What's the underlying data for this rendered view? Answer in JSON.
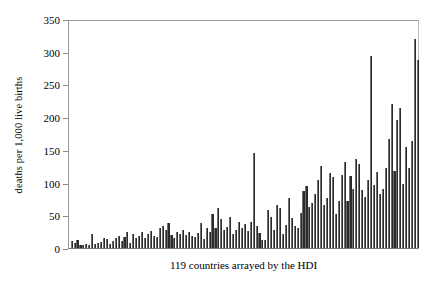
{
  "chart_data": {
    "type": "bar",
    "title": "",
    "xlabel": "119 countries arrayed by the HDI",
    "ylabel": "deaths per 1,000 live births",
    "ylim": [
      0,
      350
    ],
    "yticks": [
      0,
      50,
      100,
      150,
      200,
      250,
      300,
      350
    ],
    "ytick_labels": [
      "0",
      "50",
      "100",
      "150",
      "200",
      "250",
      "300",
      "350"
    ],
    "grid": false,
    "legend": null,
    "n_categories": 119,
    "categories_note": "119 countries ordered by Human Development Index (HDI), unlabeled on axis",
    "bar_color": "#2b2b2b",
    "values": [
      10,
      7,
      13,
      5,
      4,
      6,
      5,
      21,
      6,
      7,
      9,
      15,
      14,
      6,
      10,
      16,
      18,
      11,
      17,
      24,
      8,
      22,
      15,
      18,
      24,
      16,
      22,
      26,
      18,
      17,
      30,
      33,
      27,
      38,
      20,
      16,
      25,
      22,
      27,
      20,
      24,
      19,
      17,
      23,
      38,
      14,
      30,
      24,
      52,
      31,
      61,
      44,
      28,
      32,
      47,
      22,
      28,
      40,
      31,
      37,
      26,
      39,
      145,
      34,
      23,
      12,
      13,
      58,
      48,
      27,
      65,
      61,
      21,
      35,
      76,
      46,
      34,
      30,
      53,
      87,
      95,
      63,
      69,
      83,
      104,
      125,
      66,
      76,
      114,
      108,
      52,
      72,
      111,
      131,
      72,
      110,
      90,
      136,
      129,
      88,
      78,
      104,
      293,
      97,
      116,
      82,
      90,
      123,
      166,
      220,
      118,
      195,
      214,
      98,
      155,
      123,
      163,
      320,
      287
    ]
  }
}
